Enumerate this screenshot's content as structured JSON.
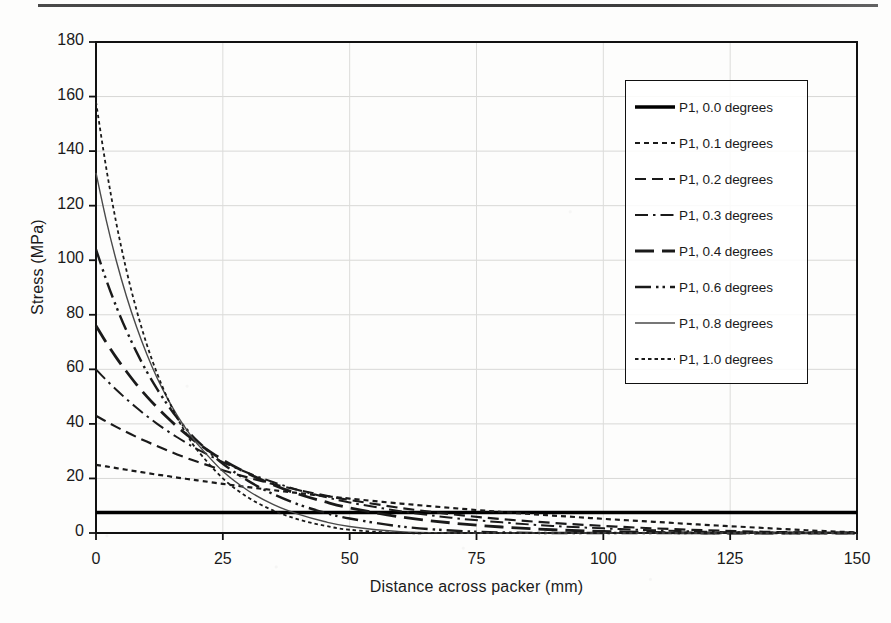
{
  "figure": {
    "x_axis": {
      "title": "Distance across packer (mm)",
      "min": 0,
      "max": 150,
      "tick_step": 25,
      "ticks": [
        "0",
        "25",
        "50",
        "75",
        "100",
        "125",
        "150"
      ]
    },
    "y_axis": {
      "title": "Stress (MPa)",
      "min": 0,
      "max": 180,
      "tick_step": 20,
      "ticks": [
        "0",
        "20",
        "40",
        "60",
        "80",
        "100",
        "120",
        "140",
        "160",
        "180"
      ]
    },
    "legend": {
      "position": "top-right-inside",
      "items": [
        {
          "label": "P1, 0.0 degrees",
          "style": "solid-thick"
        },
        {
          "label": "P1, 0.1 degrees",
          "style": "dotted"
        },
        {
          "label": "P1, 0.2 degrees",
          "style": "dashed"
        },
        {
          "label": "P1, 0.3 degrees",
          "style": "dash-dot"
        },
        {
          "label": "P1, 0.4 degrees",
          "style": "long-dash"
        },
        {
          "label": "P1, 0.6 degrees",
          "style": "dash-dot-dot"
        },
        {
          "label": "P1, 0.8 degrees",
          "style": "solid-thin"
        },
        {
          "label": "P1, 1.0 degrees",
          "style": "fine-dotted"
        }
      ]
    }
  },
  "chart_data": {
    "type": "line",
    "title": "",
    "xlabel": "Distance across packer (mm)",
    "ylabel": "Stress (MPa)",
    "xlim": [
      0,
      150
    ],
    "ylim": [
      0,
      180
    ],
    "xticks": [
      0,
      25,
      50,
      75,
      100,
      125,
      150
    ],
    "yticks": [
      0,
      20,
      40,
      60,
      80,
      100,
      120,
      140,
      160,
      180
    ],
    "grid": "faint major gridlines, both axes",
    "legend_position": "upper right (inside plot area)",
    "x": [
      0,
      2,
      4,
      6,
      8,
      10,
      12,
      14,
      16,
      18,
      20,
      25,
      30,
      35,
      40,
      45,
      50,
      60,
      70,
      80,
      90,
      100,
      110,
      120,
      130,
      140,
      150
    ],
    "series": [
      {
        "name": "P1, 0.0 degrees",
        "style": "solid-thick",
        "color": "#000000",
        "values": [
          7.5,
          7.5,
          7.5,
          7.5,
          7.5,
          7.5,
          7.5,
          7.5,
          7.5,
          7.5,
          7.5,
          7.5,
          7.5,
          7.5,
          7.5,
          7.5,
          7.5,
          7.5,
          7.5,
          7.5,
          7.5,
          7.5,
          7.5,
          7.5,
          7.5,
          7.5,
          7.5
        ]
      },
      {
        "name": "P1, 0.1 degrees",
        "style": "dotted",
        "color": "#1a1a1a",
        "values": [
          25.0,
          24.4,
          23.8,
          23.2,
          22.6,
          22.0,
          21.4,
          20.9,
          20.3,
          19.8,
          19.3,
          18.0,
          16.8,
          15.7,
          14.6,
          13.6,
          12.6,
          10.8,
          9.2,
          7.7,
          6.4,
          5.2,
          4.1,
          3.0,
          2.0,
          1.0,
          0.2
        ]
      },
      {
        "name": "P1, 0.2 degrees",
        "style": "dashed",
        "color": "#1a1a1a",
        "values": [
          43.0,
          40.9,
          38.9,
          37.0,
          35.2,
          33.5,
          31.9,
          30.3,
          28.8,
          27.4,
          26.1,
          23.0,
          20.3,
          17.9,
          15.7,
          13.8,
          12.1,
          9.2,
          6.9,
          5.1,
          3.7,
          2.6,
          1.7,
          1.0,
          0.5,
          0.2,
          0.0
        ]
      },
      {
        "name": "P1, 0.3 degrees",
        "style": "dash-dot",
        "color": "#1a1a1a",
        "values": [
          60.0,
          56.1,
          52.5,
          49.1,
          45.9,
          42.9,
          40.1,
          37.5,
          35.1,
          32.8,
          30.7,
          26.0,
          22.0,
          18.6,
          15.7,
          13.3,
          11.2,
          8.0,
          5.6,
          3.9,
          2.6,
          1.7,
          1.0,
          0.5,
          0.2,
          0.0,
          0.0
        ]
      },
      {
        "name": "P1, 0.4 degrees",
        "style": "long-dash",
        "color": "#1a1a1a",
        "values": [
          76.0,
          69.9,
          64.3,
          59.2,
          54.4,
          50.1,
          46.1,
          42.4,
          39.0,
          35.9,
          33.0,
          26.8,
          21.8,
          17.6,
          14.2,
          11.5,
          9.2,
          5.9,
          3.7,
          2.2,
          1.2,
          0.6,
          0.2,
          0.0,
          0.0,
          0.0,
          0.0
        ]
      },
      {
        "name": "P1, 0.6 degrees",
        "style": "dash-dot-dot",
        "color": "#1a1a1a",
        "values": [
          104.0,
          92.9,
          83.0,
          74.2,
          66.3,
          59.2,
          52.9,
          47.3,
          42.2,
          37.7,
          33.7,
          25.4,
          19.1,
          14.2,
          10.4,
          7.5,
          5.3,
          2.4,
          0.9,
          0.2,
          0.0,
          0.0,
          0.0,
          0.0,
          0.0,
          0.0,
          0.0
        ]
      },
      {
        "name": "P1, 0.8 degrees",
        "style": "solid-thin",
        "color": "#4a4a4a",
        "values": [
          132.0,
          114.8,
          99.8,
          86.8,
          75.5,
          65.6,
          57.0,
          49.6,
          43.1,
          37.5,
          32.6,
          22.6,
          15.5,
          10.4,
          6.8,
          4.2,
          2.4,
          0.5,
          0.0,
          0.0,
          0.0,
          0.0,
          0.0,
          0.0,
          0.0,
          0.0,
          0.0
        ]
      },
      {
        "name": "P1, 1.0 degrees",
        "style": "fine-dotted",
        "color": "#1a1a1a",
        "values": [
          158.0,
          134.0,
          113.6,
          96.3,
          81.7,
          69.2,
          58.7,
          49.8,
          42.2,
          35.8,
          30.3,
          20.0,
          13.0,
          8.2,
          4.9,
          2.7,
          1.2,
          0.0,
          0.0,
          0.0,
          0.0,
          0.0,
          0.0,
          0.0,
          0.0,
          0.0,
          0.0
        ]
      }
    ]
  }
}
